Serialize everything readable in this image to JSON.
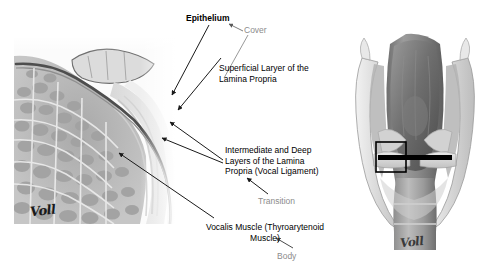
{
  "figure": {
    "background_color": "#ffffff"
  },
  "micrograph": {
    "name": "vocal-fold-histology",
    "description": "Coronal histological section of the vocal fold showing epithelium, lamina propria layers and thyroarytenoid (vocalis) muscle",
    "signature": "Voll",
    "tissue_tone": "#b9b9b9",
    "epithelium_color": "#4a4a4a"
  },
  "larynx": {
    "name": "larynx-coronal-illustration",
    "description": "Posterior-coronal view of the larynx with boxed region of interest at the vocal fold level",
    "signature": "Voll",
    "marker_color": "#000000",
    "roi_box": {
      "x": 32,
      "y": 114,
      "width": 30,
      "height": 30
    }
  },
  "labels": {
    "epithelium": "Epithelium",
    "cover": "Cover",
    "superficial_layer": "Superficial Laryer of the\nLamina Propria",
    "intermediate_deep": "Intermediate and Deep\nLayers of the Lamina\nPropria (Vocal Ligament)",
    "transition": "Transition",
    "vocalis_muscle": "Vocalis Muscle (Thyroarytenoid\nMuscle)",
    "body": "Body"
  },
  "colors": {
    "label_black": "#000000",
    "label_gray": "#8c8c8c",
    "leader_line": "#1a1a1a",
    "bracket_line": "#8c8c8c"
  }
}
